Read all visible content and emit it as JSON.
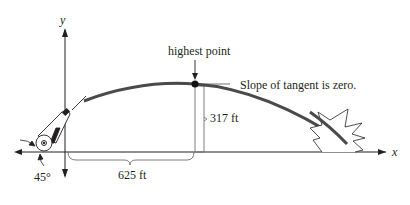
{
  "axes": {
    "x_label": "x",
    "y_label": "y"
  },
  "labels": {
    "highest_point": "highest point",
    "slope_note": "Slope of tangent is zero.",
    "height": "317 ft",
    "distance": "625 ft",
    "angle": "45°"
  },
  "icons": {
    "cannon": "cannon-icon",
    "impact": "explosion-icon"
  },
  "colors": {
    "trajectory": "#4a4a4a",
    "ink": "#231f20",
    "thin_line": "#6d6e71"
  },
  "values": {
    "max_height_ft": 317,
    "horizontal_distance_to_peak_ft": 625,
    "launch_angle_deg": 45
  }
}
